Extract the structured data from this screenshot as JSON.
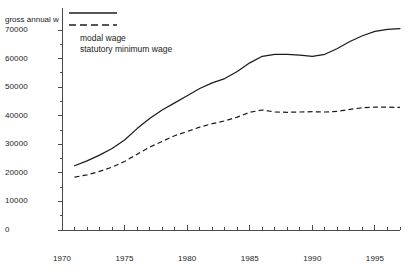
{
  "figure": {
    "cut_title": "",
    "axis_title_truncated": "gross annual w"
  },
  "legend": {
    "items": [
      {
        "label": "modal wage",
        "style": "solid",
        "color": "#1a1a1a"
      },
      {
        "label": "statutory minimum wage",
        "style": "dashed",
        "color": "#1a1a1a"
      }
    ]
  },
  "chart_data": {
    "type": "line",
    "title": "",
    "xlabel": "",
    "ylabel": "gross annual w",
    "xlim": [
      1970,
      1997
    ],
    "ylim": [
      0,
      70000
    ],
    "xticks": [
      1970,
      1975,
      1980,
      1985,
      1990,
      1995
    ],
    "yticks": [
      0,
      10000,
      20000,
      30000,
      40000,
      50000,
      60000,
      70000
    ],
    "xtick_labels": [
      "1970",
      "1975",
      "1980",
      "1985",
      "1990",
      "1995"
    ],
    "ytick_labels": [
      "0",
      "10000",
      "20000",
      "30000",
      "40000",
      "50000",
      "60000",
      "70000"
    ],
    "grid": false,
    "minor_ticks": true,
    "legend_position": "top-left",
    "x": [
      1971,
      1972,
      1973,
      1974,
      1975,
      1976,
      1977,
      1978,
      1979,
      1980,
      1981,
      1982,
      1983,
      1984,
      1985,
      1986,
      1987,
      1988,
      1989,
      1990,
      1991,
      1992,
      1993,
      1994,
      1995,
      1996,
      1997
    ],
    "series": [
      {
        "name": "modal wage",
        "style": "solid",
        "values": [
          22500,
          24200,
          26200,
          28500,
          31500,
          35500,
          39000,
          42000,
          44500,
          47000,
          49500,
          51500,
          53000,
          55500,
          58500,
          60800,
          61500,
          61500,
          61200,
          60800,
          61500,
          63500,
          66000,
          68000,
          69500,
          70200,
          70500
        ]
      },
      {
        "name": "statutory minimum wage",
        "style": "dashed",
        "values": [
          18500,
          19300,
          20500,
          22000,
          24000,
          26500,
          29000,
          31000,
          33000,
          34500,
          36000,
          37200,
          38200,
          39500,
          41200,
          42000,
          41300,
          41200,
          41300,
          41400,
          41300,
          41500,
          42200,
          42800,
          43000,
          43000,
          42900
        ]
      }
    ]
  }
}
